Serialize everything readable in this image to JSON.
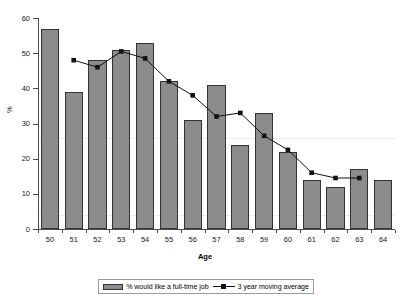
{
  "chart_data": {
    "type": "bar",
    "title": "",
    "xlabel": "Age",
    "ylabel": "%",
    "categories": [
      "50",
      "51",
      "52",
      "53",
      "54",
      "55",
      "56",
      "57",
      "58",
      "59",
      "60",
      "61",
      "62",
      "63",
      "64"
    ],
    "ylim": [
      0,
      60
    ],
    "yticks": [
      "0",
      "10",
      "20",
      "30",
      "40",
      "50",
      "60"
    ],
    "grid": false,
    "legend_position": "bottom",
    "series": [
      {
        "name": "% would like a full-time job",
        "kind": "bar",
        "color": "#8c8c8c",
        "values": [
          57,
          39,
          48,
          51,
          53,
          42,
          31,
          41,
          24,
          33,
          22,
          14,
          12,
          17,
          14
        ]
      },
      {
        "name": "3 year moving average",
        "kind": "line",
        "color": "#111111",
        "x": [
          "51",
          "52",
          "53",
          "54",
          "55",
          "56",
          "57",
          "58",
          "59",
          "60",
          "61",
          "62",
          "63"
        ],
        "values": [
          48,
          46,
          50.5,
          48.5,
          42,
          38,
          32,
          33,
          26.5,
          22.5,
          16,
          14.5,
          14.5
        ]
      }
    ]
  },
  "legend": {
    "bar_label": "% would like a full-time job",
    "line_label": "3 year moving average"
  },
  "axes": {
    "x_title": "Age",
    "y_title": "%"
  }
}
